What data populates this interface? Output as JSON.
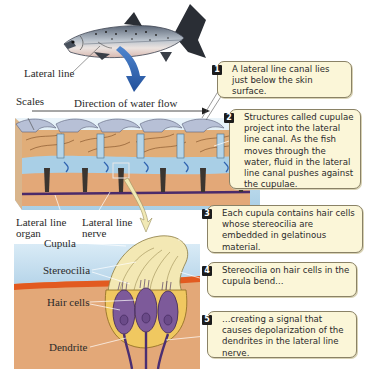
{
  "figure": {
    "labels": {
      "lateral_line": "Lateral line",
      "scales": "Scales",
      "direction": "Direction of water flow",
      "lateral_line_organ_1": "Lateral line",
      "lateral_line_organ_2": "organ",
      "lateral_line_nerve_1": "Lateral line",
      "lateral_line_nerve_2": "nerve",
      "cupula": "Cupula",
      "stereocilia": "Stereocilia",
      "hair_cells": "Hair cells",
      "dendrite": "Dendrite"
    },
    "callouts": [
      {
        "num": "1",
        "text": "A lateral line canal lies just below the skin surface."
      },
      {
        "num": "2",
        "text": "Structures called cupulae project into the lateral line canal. As the fish moves through the water, fluid in the lateral line canal pushes against the cupulae."
      },
      {
        "num": "3",
        "text": "Each cupula contains hair cells whose stereocilia are embedded in gelatinous material."
      },
      {
        "num": "4",
        "text": "Stereocilia on hair cells in the cupula bend…"
      },
      {
        "num": "5",
        "text": "…creating a signal that causes depolarization of the dendrites in the lateral line nerve."
      }
    ],
    "colors": {
      "callout_bg": "#fbf6d8",
      "callout_border": "#8a8266",
      "arrow_blue": "#2f63b0",
      "tissue": "#e3a878",
      "canal_fluid": "#a9cfe6",
      "hair_cell": "#7d5a9a",
      "cupula": "#f3e8b4"
    }
  }
}
